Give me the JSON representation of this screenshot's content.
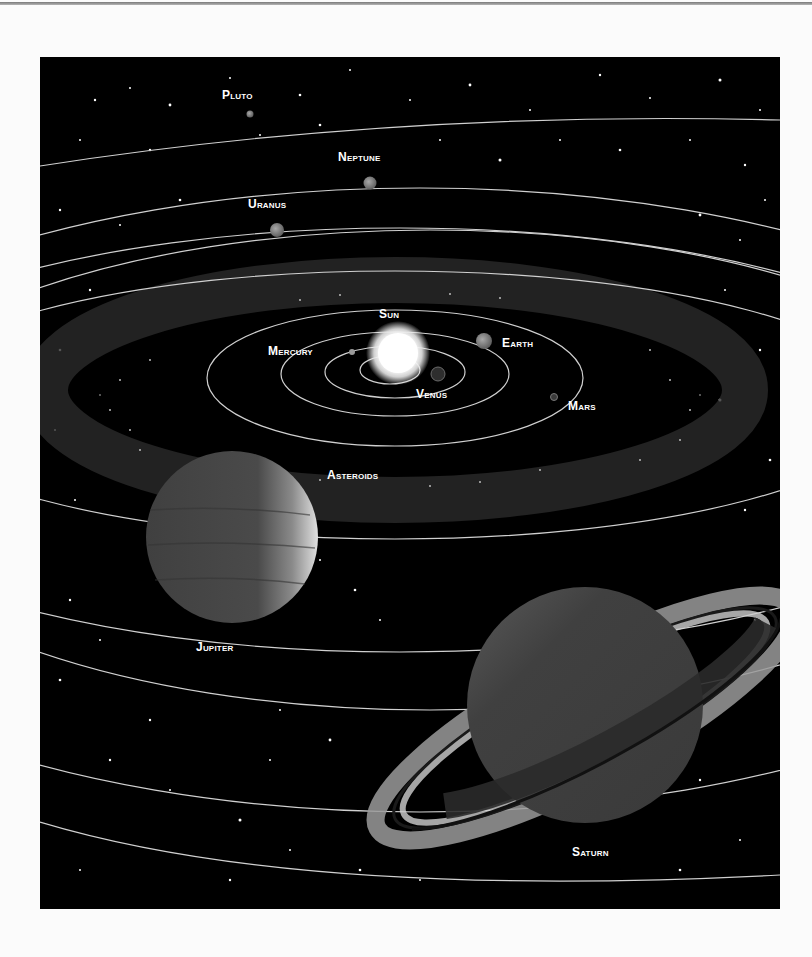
{
  "diagram": {
    "colors": {
      "background": "#000000",
      "orbit": "#d8d8d8",
      "label": "#ffffff",
      "page": "#fbfbfb"
    },
    "labels": [
      {
        "id": "pluto",
        "text": "Pluto",
        "x": 222,
        "y": 88
      },
      {
        "id": "neptune",
        "text": "Neptune",
        "x": 338,
        "y": 150
      },
      {
        "id": "uranus",
        "text": "Uranus",
        "x": 248,
        "y": 197
      },
      {
        "id": "sun",
        "text": "Sun",
        "x": 379,
        "y": 307
      },
      {
        "id": "mercury",
        "text": "Mercury",
        "x": 268,
        "y": 344
      },
      {
        "id": "earth",
        "text": "Earth",
        "x": 502,
        "y": 336
      },
      {
        "id": "venus",
        "text": "Venus",
        "x": 416,
        "y": 387
      },
      {
        "id": "mars",
        "text": "Mars",
        "x": 568,
        "y": 399
      },
      {
        "id": "asteroids",
        "text": "Asteroids",
        "x": 327,
        "y": 468
      },
      {
        "id": "jupiter",
        "text": "Jupiter",
        "x": 196,
        "y": 640
      },
      {
        "id": "saturn",
        "text": "Saturn",
        "x": 572,
        "y": 845
      }
    ],
    "bodies": [
      "Sun",
      "Mercury",
      "Venus",
      "Earth",
      "Mars",
      "Asteroids",
      "Jupiter",
      "Saturn",
      "Uranus",
      "Neptune",
      "Pluto"
    ]
  }
}
